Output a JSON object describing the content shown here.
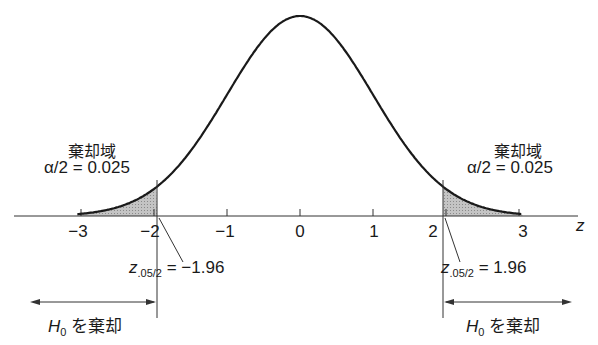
{
  "diagram": {
    "type": "normal-distribution-two-tailed-test",
    "axis_label": "z",
    "ticks": [
      "−3",
      "−2",
      "−1",
      "0",
      "1",
      "2",
      "3"
    ],
    "tick_values": [
      -3,
      -2,
      -1,
      0,
      1,
      2,
      3
    ],
    "left_region": {
      "title": "棄却域",
      "alpha_label": "α/2 = 0.025",
      "critical_label_var": "z",
      "critical_label_sub": ".05/2",
      "critical_label_value": " = −1.96",
      "reject_label_var": "H",
      "reject_label_sub": "0",
      "reject_label_text": " を棄却"
    },
    "right_region": {
      "title": "棄却域",
      "alpha_label": "α/2 = 0.025",
      "critical_label_var": "z",
      "critical_label_sub": ".05/2",
      "critical_label_value": " = 1.96",
      "reject_label_var": "H",
      "reject_label_sub": "0",
      "reject_label_text": " を棄却"
    },
    "critical_values": [
      -1.96,
      1.96
    ],
    "colors": {
      "curve": "#1a1a1a",
      "shade": "#b8b8b8",
      "axis": "#333333"
    }
  }
}
